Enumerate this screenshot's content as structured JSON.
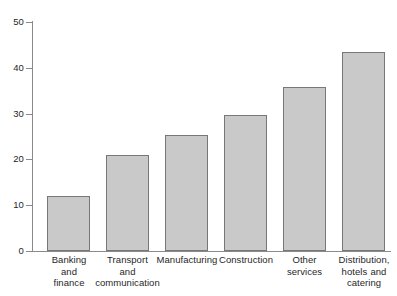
{
  "chart_data": {
    "type": "bar",
    "title": "",
    "subtitle": "",
    "xlabel": "",
    "ylabel": "",
    "ylim": [
      0,
      50
    ],
    "ytick_labels": [
      "0",
      "10",
      "20",
      "30",
      "40",
      "50"
    ],
    "ytick_values": [
      0,
      10,
      20,
      30,
      40,
      50
    ],
    "grid": false,
    "legend": null,
    "bar_fill_color": "#c9c9c9",
    "bar_border_color": "#777777",
    "axis_color": "#8a8a8a",
    "categories": [
      "Banking and finance",
      "Transport and communication",
      "Manufacturing",
      "Construction",
      "Other services",
      "Distribution, hotels and catering"
    ],
    "category_lines": [
      [
        "Banking",
        "and",
        "finance"
      ],
      [
        "Transport",
        "and",
        "communication"
      ],
      [
        "Manufacturing"
      ],
      [
        "Construction"
      ],
      [
        "Other",
        "services"
      ],
      [
        "Distribution,",
        "hotels and",
        "catering"
      ]
    ],
    "values": [
      12.0,
      20.9,
      25.3,
      29.6,
      35.8,
      43.5
    ]
  }
}
